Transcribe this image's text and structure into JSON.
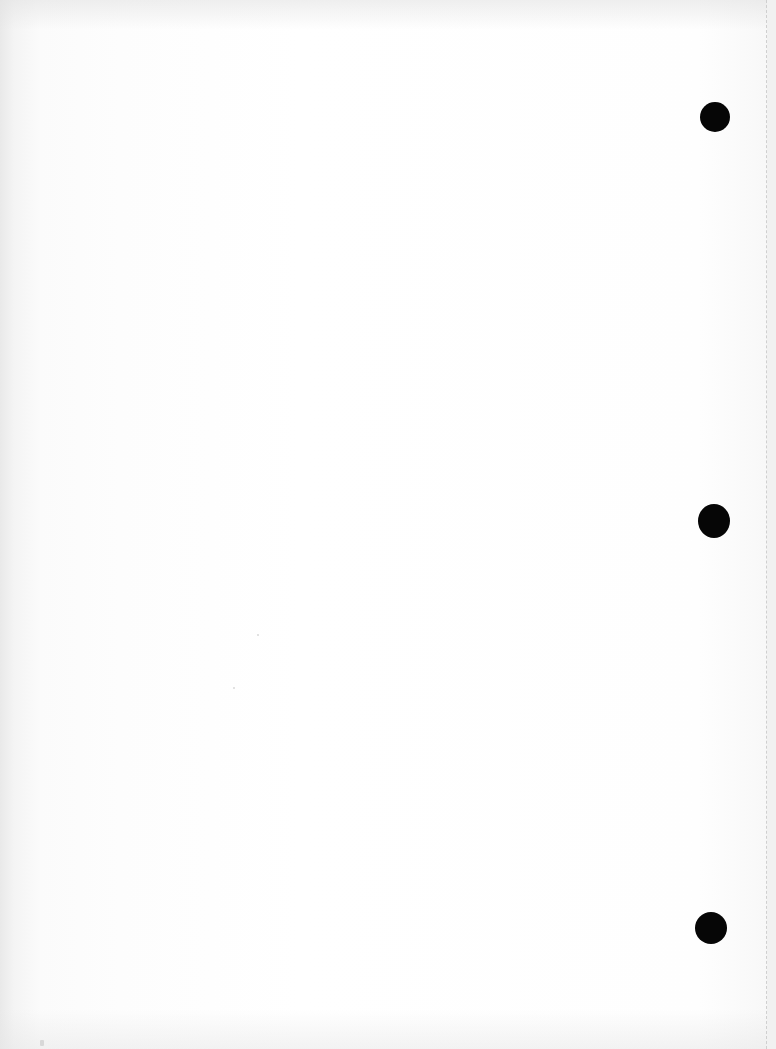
{
  "page": {
    "type": "blank-scanned-sheet",
    "background_color": "#fdfdfd",
    "text_content": ""
  },
  "punch_holes": [
    {
      "label": "top",
      "cx": 715,
      "cy": 117,
      "rx": 15,
      "ry": 15,
      "color": "#060606"
    },
    {
      "label": "middle",
      "cx": 714,
      "cy": 521,
      "rx": 16,
      "ry": 17,
      "color": "#060606"
    },
    {
      "label": "bottom",
      "cx": 711,
      "cy": 928,
      "rx": 16,
      "ry": 16,
      "color": "#060606"
    }
  ],
  "fold_line": {
    "x": 766,
    "color": "#cfcfcf"
  }
}
